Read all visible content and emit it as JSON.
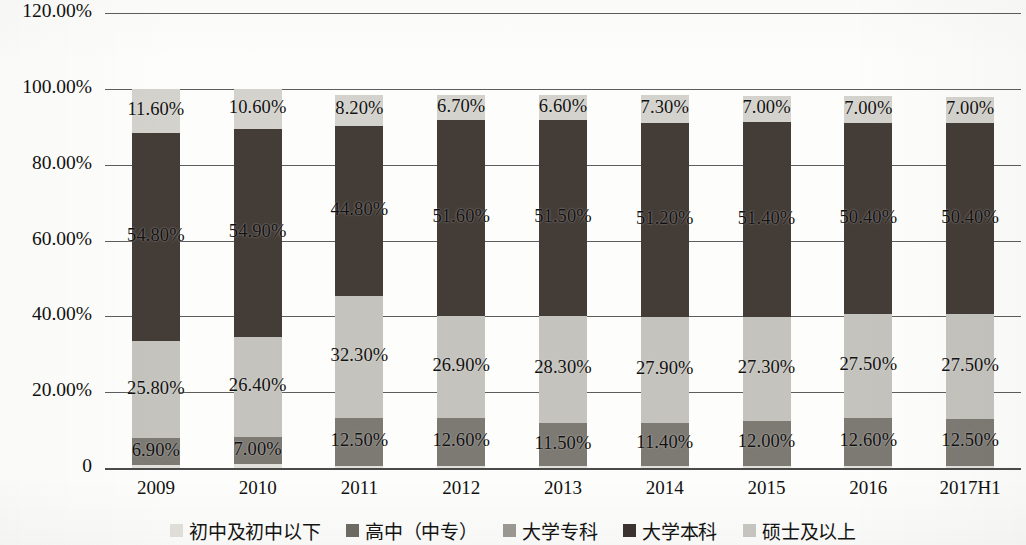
{
  "chart_data": {
    "type": "bar",
    "stacked": true,
    "title": "",
    "subtitle": "",
    "xlabel": "",
    "ylabel": "",
    "grid": true,
    "legend_position": "bottom",
    "ylim": [
      0,
      120
    ],
    "ytick_labels": [
      "0",
      "20.00%",
      "40.00%",
      "60.00%",
      "80.00%",
      "100.00%",
      "120.00%"
    ],
    "ytick_values": [
      0,
      20,
      40,
      60,
      80,
      100,
      120
    ],
    "categories": [
      "2009",
      "2010",
      "2011",
      "2012",
      "2013",
      "2014",
      "2015",
      "2016",
      "2017H1"
    ],
    "series": [
      {
        "name": "初中及初中以下",
        "color": "#e3e1dc",
        "values": [
          0.9,
          1.1,
          0.6,
          0.6,
          0.4,
          0.5,
          0.5,
          0.5,
          0.5
        ],
        "labels": [
          "",
          "",
          "",
          "",
          "",
          "",
          "",
          "",
          ""
        ]
      },
      {
        "name": "大学专科",
        "color": "#7d7a74",
        "values": [
          6.9,
          7.0,
          12.5,
          12.6,
          11.5,
          11.4,
          12.0,
          12.6,
          12.5
        ],
        "labels": [
          "6.90%",
          "7.00%",
          "12.50%",
          "12.60%",
          "11.50%",
          "11.40%",
          "12.00%",
          "12.60%",
          "12.50%"
        ]
      },
      {
        "name": "高中（中专）",
        "color": "#c5c3bd",
        "values": [
          25.8,
          26.4,
          32.3,
          26.9,
          28.3,
          27.9,
          27.3,
          27.5,
          27.5
        ],
        "labels": [
          "25.80%",
          "26.40%",
          "32.30%",
          "26.90%",
          "28.30%",
          "27.90%",
          "27.30%",
          "27.50%",
          "27.50%"
        ]
      },
      {
        "name": "大学本科",
        "color": "#443c37",
        "values": [
          54.8,
          54.9,
          44.8,
          51.6,
          51.5,
          51.2,
          51.4,
          50.4,
          50.4
        ],
        "labels": [
          "54.80%",
          "54.90%",
          "44.80%",
          "51.60%",
          "51.50%",
          "51.20%",
          "51.40%",
          "50.40%",
          "50.40%"
        ]
      },
      {
        "name": "硕士及以上",
        "color": "#d4d2cc",
        "values": [
          11.6,
          10.6,
          8.2,
          6.7,
          6.6,
          7.3,
          7.0,
          7.0,
          7.0
        ],
        "labels": [
          "11.60%",
          "10.60%",
          "8.20%",
          "6.70%",
          "6.60%",
          "7.30%",
          "7.00%",
          "7.00%",
          "7.00%"
        ]
      }
    ],
    "legend": [
      {
        "label": "初中及初中以下",
        "color": "#e3e1dc"
      },
      {
        "label": "高中（中专）",
        "color": "#6f6c66"
      },
      {
        "label": "大学专科",
        "color": "#9d9a94"
      },
      {
        "label": "大学本科",
        "color": "#3b3430"
      },
      {
        "label": "硕士及以上",
        "color": "#c9c7c1"
      }
    ]
  }
}
